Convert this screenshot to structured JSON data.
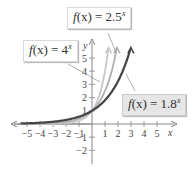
{
  "chart_data": {
    "type": "line",
    "title": "",
    "xlabel": "x",
    "ylabel": "y",
    "xlim": [
      -5.5,
      5.5
    ],
    "ylim": [
      -2.5,
      6
    ],
    "x_ticks": [
      "-5",
      "-4",
      "-3",
      "-2",
      "-1",
      "1",
      "2",
      "3",
      "4",
      "5"
    ],
    "y_ticks": [
      "-2",
      "-1",
      "1",
      "2",
      "3",
      "4",
      "5"
    ],
    "grid": false,
    "series": [
      {
        "name": "f(x) = 4^x",
        "base": 4,
        "color": "#c8c8c8"
      },
      {
        "name": "f(x) = 2.5^x",
        "base": 2.5,
        "color": "#b0b0b0"
      },
      {
        "name": "f(x) = 1.8^x",
        "base": 1.8,
        "color": "#444444"
      }
    ]
  },
  "labels": {
    "f4": {
      "lhs": "f",
      "arg": "(x) = 4",
      "exp": "x"
    },
    "f25": {
      "lhs": "f",
      "arg": "(x) = 2.5",
      "exp": "x"
    },
    "f18": {
      "lhs": "f",
      "arg": "(x) = 1.8",
      "exp": "x"
    }
  },
  "axes": {
    "x_label": "x",
    "y_label": "y"
  }
}
